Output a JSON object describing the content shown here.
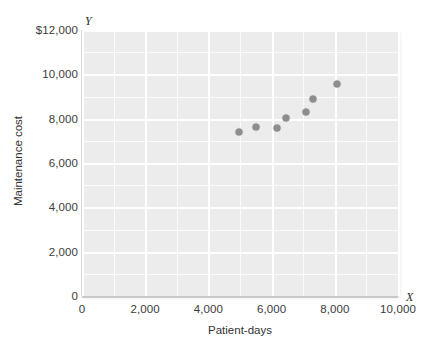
{
  "chart_data": {
    "type": "scatter",
    "title": "",
    "xlabel": "Patient-days",
    "ylabel": "Maintenance cost",
    "x_axis_letter": "X",
    "y_axis_letter": "Y",
    "xlim": [
      0,
      10000
    ],
    "ylim": [
      0,
      12000
    ],
    "xticks": [
      0,
      2000,
      4000,
      6000,
      8000,
      10000
    ],
    "xtick_labels": [
      "0",
      "2,000",
      "4,000",
      "6,000",
      "8,000",
      "10,000"
    ],
    "yticks": [
      0,
      2000,
      4000,
      6000,
      8000,
      10000,
      12000
    ],
    "ytick_labels": [
      "0",
      "2,000",
      "4,000",
      "6,000",
      "8,000",
      "10,000",
      "$12,000"
    ],
    "grid": true,
    "grid_minor_step_x": 1000,
    "grid_minor_step_y": 1000,
    "grid_major_step_x": 2000,
    "grid_major_step_y": 2000,
    "legend": null,
    "points": [
      {
        "x": 4970,
        "y": 7400
      },
      {
        "x": 5500,
        "y": 7640
      },
      {
        "x": 6160,
        "y": 7580
      },
      {
        "x": 6470,
        "y": 8030
      },
      {
        "x": 7090,
        "y": 8300
      },
      {
        "x": 7310,
        "y": 8890
      },
      {
        "x": 8060,
        "y": 9580
      }
    ],
    "colors": {
      "plot_background": "#ececec",
      "gridline_minor": "#fbfbfb",
      "gridline_major": "#ffffff",
      "point": "#8d8d8d",
      "axis": "#c9c9c9",
      "text": "#333333",
      "page_background": "#ffffff"
    }
  }
}
